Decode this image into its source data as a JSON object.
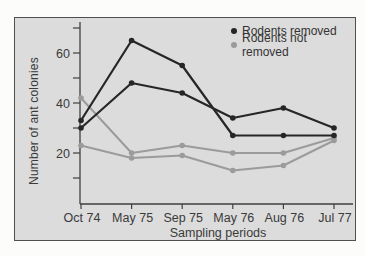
{
  "colors": {
    "page_bg": "#fcfcfa",
    "panel_bg": "#dcdcdc",
    "panel_border": "#4f4f4f",
    "axis": "#3f3f3f",
    "text": "#3a3a3a",
    "dark_series": "#262626",
    "gray_series": "#9b9b9b"
  },
  "chart_data": {
    "type": "line",
    "title": "",
    "xlabel": "Sampling periods",
    "ylabel": "Number of ant colonies",
    "categories": [
      "Oct 74",
      "May 75",
      "Sep 75",
      "May 76",
      "Aug 76",
      "Jul 77"
    ],
    "y_axis": {
      "min": 0,
      "max": 72,
      "major_ticks": [
        20,
        40,
        60
      ],
      "minor_ticks": [
        10,
        30,
        50,
        70
      ]
    },
    "grid": false,
    "legend_position": "top-right",
    "series": [
      {
        "name": "Rodents removed",
        "replicate": 1,
        "color": "#262626",
        "values": [
          33,
          65,
          55,
          27,
          27,
          27
        ]
      },
      {
        "name": "Rodents removed",
        "replicate": 2,
        "color": "#262626",
        "values": [
          30,
          48,
          44,
          34,
          38,
          30
        ]
      },
      {
        "name": "Rodents not removed",
        "replicate": 1,
        "color": "#9b9b9b",
        "values": [
          42,
          20,
          23,
          20,
          20,
          26
        ]
      },
      {
        "name": "Rodents not removed",
        "replicate": 2,
        "color": "#9b9b9b",
        "values": [
          23,
          18,
          19,
          13,
          15,
          25
        ]
      }
    ],
    "legend": [
      {
        "label": "Rodents removed",
        "color": "#262626"
      },
      {
        "label": "Rodents not removed",
        "color": "#9b9b9b"
      }
    ]
  }
}
